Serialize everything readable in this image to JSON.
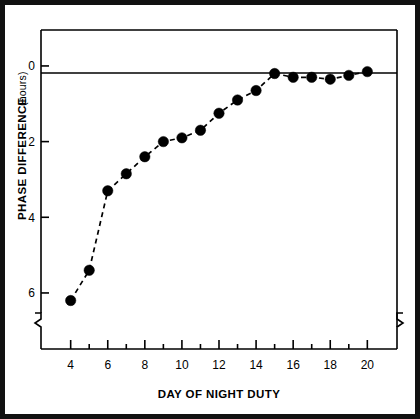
{
  "figure": {
    "border_color": "#111111",
    "background": "#ffffff"
  },
  "chart_data": {
    "type": "line",
    "title": "",
    "xlabel": "DAY OF NIGHT DUTY",
    "ylabel": "PHASE DIFFERENCE",
    "ylabel_units": "(hours)",
    "x": [
      4,
      5,
      6,
      7,
      8,
      9,
      10,
      11,
      12,
      13,
      14,
      15,
      16,
      17,
      18,
      19,
      20
    ],
    "values": [
      6.2,
      5.4,
      3.3,
      2.85,
      2.4,
      2.0,
      1.9,
      1.7,
      1.25,
      0.9,
      0.65,
      0.2,
      0.3,
      0.3,
      0.35,
      0.25,
      0.15
    ],
    "series": [
      {
        "name": "Phase difference",
        "values": [
          6.2,
          5.4,
          3.3,
          2.85,
          2.4,
          2.0,
          1.9,
          1.7,
          1.25,
          0.9,
          0.65,
          0.2,
          0.3,
          0.3,
          0.35,
          0.25,
          0.15
        ]
      }
    ],
    "xlim": [
      2.4,
      21.6
    ],
    "ylim": [
      6.9,
      -0.95
    ],
    "y_axis_inverted": true,
    "xticks": [
      4,
      5,
      6,
      7,
      8,
      9,
      10,
      11,
      12,
      13,
      14,
      15,
      16,
      17,
      18,
      19,
      20
    ],
    "xtick_labels": [
      "4",
      "",
      "6",
      "",
      "8",
      "",
      "10",
      "",
      "12",
      "",
      "14",
      "",
      "16",
      "",
      "18",
      "",
      "20"
    ],
    "yticks": [
      0,
      2,
      4,
      6
    ],
    "ytick_labels": [
      "0",
      "2",
      "4",
      "6"
    ],
    "grid": false,
    "legend": "none",
    "line_style": "dashed",
    "marker": "filled-circle",
    "marker_color": "#000000",
    "line_color": "#000000",
    "zero_reference_line": 0,
    "axis_break_left": true,
    "axis_break_right": true
  }
}
